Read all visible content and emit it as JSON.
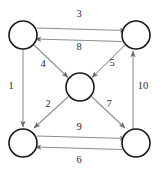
{
  "diagram": {
    "type": "directed-graph",
    "canvas": {
      "width": 161,
      "height": 170,
      "background": "#ffffff"
    },
    "style": {
      "node_stroke": "#1a1a1a",
      "node_fill": "#ffffff",
      "edge_stroke": "#8d8d8d",
      "label_color": "#2b2b2b",
      "node_radius": 14
    },
    "nodes": [
      {
        "id": "top-left",
        "label": "",
        "cx": 23,
        "cy": 35,
        "r": 14
      },
      {
        "id": "top-right",
        "label": "",
        "cx": 136,
        "cy": 35,
        "r": 14
      },
      {
        "id": "center",
        "label": "",
        "cx": 80,
        "cy": 87,
        "r": 14
      },
      {
        "id": "bottom-left",
        "label": "",
        "cx": 23,
        "cy": 143,
        "r": 14
      },
      {
        "id": "bottom-right",
        "label": "",
        "cx": 136,
        "cy": 143,
        "r": 14
      }
    ],
    "edges": [
      {
        "id": "edge-1",
        "label": "1",
        "from": "top-left",
        "to": "bottom-left",
        "label_x": 11,
        "label_y": 86
      },
      {
        "id": "edge-2",
        "label": "2",
        "from": "center",
        "to": "bottom-left",
        "label_x": 48,
        "label_y": 104
      },
      {
        "id": "edge-3",
        "label": "3",
        "from": "top-left",
        "to": "top-right",
        "label_x": 79,
        "label_y": 14
      },
      {
        "id": "edge-4",
        "label": "4",
        "from": "top-left",
        "to": "center",
        "label_x": 43,
        "label_y": 64
      },
      {
        "id": "edge-5",
        "label": "5",
        "from": "top-right",
        "to": "center",
        "label_x": 112,
        "label_y": 63
      },
      {
        "id": "edge-6",
        "label": "6",
        "from": "bottom-right",
        "to": "bottom-left",
        "label_x": 79,
        "label_y": 160
      },
      {
        "id": "edge-7",
        "label": "7",
        "from": "center",
        "to": "bottom-right",
        "label_x": 109,
        "label_y": 104
      },
      {
        "id": "edge-8",
        "label": "8",
        "from": "top-right",
        "to": "top-left",
        "label_x": 79,
        "label_y": 47
      },
      {
        "id": "edge-9",
        "label": "9",
        "from": "bottom-left",
        "to": "bottom-right",
        "label_x": 79,
        "label_y": 127
      },
      {
        "id": "edge-10",
        "label": "10",
        "from": "bottom-right",
        "to": "top-right",
        "label_x": 143,
        "label_y": 86
      }
    ]
  }
}
